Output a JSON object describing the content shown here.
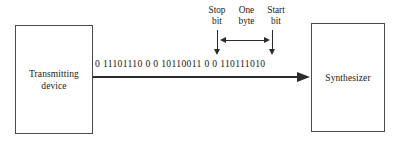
{
  "diagram": {
    "nodes": [
      {
        "id": "transmitting-device",
        "label": "Transmitting\ndevice"
      },
      {
        "id": "synthesizer",
        "label": "Synthesizer"
      }
    ],
    "signal": {
      "bitstream": "0 11101110 0 0 10110011 0 0 110111010",
      "direction": "left-to-right"
    },
    "annotations": [
      {
        "id": "stop-bit",
        "label": "Stop\nbit",
        "pointer": "down-arrow"
      },
      {
        "id": "one-byte",
        "label": "One\nbyte",
        "pointer": "double-headed-arrow"
      },
      {
        "id": "start-bit",
        "label": "Start\nbit",
        "pointer": "down-arrow"
      }
    ],
    "colors": {
      "stroke": "#4a4a4a",
      "arrow": "#2b2b2b",
      "text": "#1a1a1a",
      "background": "#ffffff"
    }
  }
}
